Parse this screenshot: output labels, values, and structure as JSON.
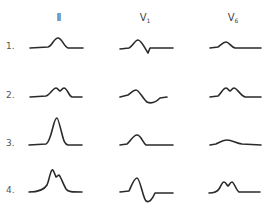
{
  "columns": [
    {
      "id": "II",
      "label": "Ⅱ",
      "sub": "",
      "x": 59
    },
    {
      "id": "V1",
      "label": "V",
      "sub": "1",
      "x": 145
    },
    {
      "id": "V6",
      "label": "V",
      "sub": "6",
      "x": 233
    }
  ],
  "rows": [
    {
      "label": "1.",
      "y": 48
    },
    {
      "label": "2.",
      "y": 97
    },
    {
      "label": "3.",
      "y": 144
    },
    {
      "label": "4.",
      "y": 192
    }
  ],
  "waveforms": {
    "r1_II": "M30 48 L48 47 C52 46 54 38 58 38 C62 38 64 47 68 48 L83 48",
    "r1_V1": "M120 49 L129 48 C133 46 135 40 138 40 C141 40 145 48 148 53 L150 48 L173 48",
    "r1_V6": "M210 48 L218 47 C221 45 223 42 226 42 C229 42 231 47 235 48 L261 48",
    "r2_II": "M30 97 L46 96 C50 95 53 88 56 88 C58 88 59 91 60 91 C61 91 62 88 64 88 C67 88 69 96 72 97 L82 97",
    "r2_V1": "M120 97 L128 95 C131 93 133 90 136 90 C139 90 143 99 147 102 C151 104 156 102 160 98 L167 97",
    "r2_V6": "M210 97 L218 96 C221 94 223 88 226 88 C228 88 229 91 230 91 C231 91 232 88 234 88 C237 88 240 95 245 97 L261 97",
    "r3_II": "M29 145 L46 144 C49 143 51 135 53 127 C55 119 56 118 57 118 C58 118 60 126 62 134 C64 142 65 144 68 145 L82 145",
    "r3_V1": "M120 145 L127 144 C130 142 133 135 137 135 C141 135 143 143 146 145 L173 145",
    "r3_V6": "M210 145 L216 144 C220 142 223 140 227 140 C232 140 236 143 242 144 L261 145",
    "r4_II": "M29 192 C37 192 44 190 47 185 C49 181 50 172 52 170 C53 169 54 172 56 177 C57 177 58 175 59 175 C61 177 63 184 66 189 C68 192 72 192 82 192",
    "r4_V1": "M120 192 L129 191 C131 187 134 178 137 178 C140 178 143 198 146 201 C149 203 152 200 155 193 L173 193",
    "r4_V6": "M209 193 C214 193 217 192 219 189 C221 186 222 182 224 182 C226 182 227 186 228 186 C229 186 230 182 232 182 C234 182 236 190 239 192 L260 192"
  }
}
